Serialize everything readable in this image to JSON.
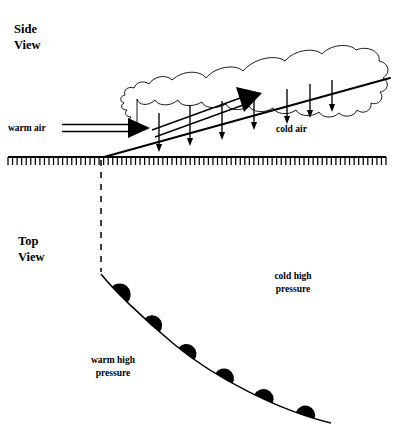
{
  "figure": {
    "background_color": "#ffffff",
    "ink_color": "#000000",
    "width": 394,
    "height": 447
  },
  "panels": {
    "side_view": {
      "label_line1": "Side",
      "label_line2": "View",
      "label_x": 14,
      "label_y": 33,
      "annotations": {
        "warm_air": {
          "text": "warm air",
          "x": 8,
          "y": 131
        },
        "cold_air": {
          "text": "cold air",
          "x": 276,
          "y": 132
        }
      },
      "ground": {
        "y": 157,
        "x_start": 8,
        "x_end": 386,
        "tick_count": 84,
        "tick_length": 8
      },
      "frontal_surface": {
        "x_start": 104,
        "y_start": 157,
        "x_end": 390,
        "y_end": 78,
        "description": "sloping warm frontal boundary rising to the right"
      },
      "warm_air_arrow": {
        "x_start": 12,
        "x_end": 138,
        "y": 128,
        "style": "double-line-with-solid-head"
      },
      "warm_overrun_arrow": {
        "x_start": 136,
        "y_start": 128,
        "x_end": 258,
        "y_end": 92,
        "style": "double-line-with-solid-head"
      },
      "precipitation_arrow_count": 7,
      "precipitation_arrows": [
        {
          "x": 159,
          "y_top": 113,
          "y_bottom": 152
        },
        {
          "x": 190,
          "y_top": 105,
          "y_bottom": 146
        },
        {
          "x": 222,
          "y_top": 101,
          "y_bottom": 140
        },
        {
          "x": 254,
          "y_top": 96,
          "y_bottom": 130
        },
        {
          "x": 287,
          "y_top": 89,
          "y_bottom": 124
        },
        {
          "x": 310,
          "y_top": 84,
          "y_bottom": 118
        },
        {
          "x": 332,
          "y_top": 80,
          "y_bottom": 112
        }
      ]
    },
    "top_view": {
      "label_line1": "Top",
      "label_line2": "View",
      "label_x": 18,
      "label_y": 245,
      "annotations": {
        "warm_high_pressure": {
          "line1": "warm high",
          "line2": "pressure",
          "x": 113,
          "y": 363
        },
        "cold_high_pressure": {
          "line1": "cold high",
          "line2": "pressure",
          "x": 293,
          "y": 279
        }
      },
      "dashed_connector": {
        "x": 101,
        "y_start": 160,
        "y_end": 272,
        "dash_pattern": "6 6"
      },
      "warm_front_curve": {
        "start_x": 101,
        "start_y": 274,
        "end_x": 331,
        "end_y": 423,
        "description": "warm front drawn as a curve bending down and to the right"
      },
      "front_symbol": "filled-semicircles",
      "semicircle_count": 6,
      "semicircles": [
        {
          "x": 122,
          "y": 292,
          "r": 11
        },
        {
          "x": 157,
          "y": 320,
          "r": 10
        },
        {
          "x": 192,
          "y": 346,
          "r": 10
        },
        {
          "x": 227,
          "y": 372,
          "r": 10
        },
        {
          "x": 261,
          "y": 392,
          "r": 10
        },
        {
          "x": 296,
          "y": 409,
          "r": 10
        }
      ]
    }
  }
}
